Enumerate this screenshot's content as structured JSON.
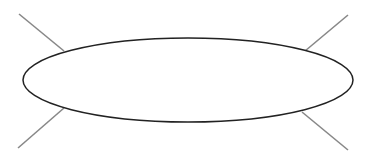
{
  "diagram": {
    "shape": "ellipse",
    "ellipse": {
      "cx": 188,
      "cy": 80,
      "rx": 165,
      "ry": 42,
      "stroke": "#222222",
      "fill": "#ffffff"
    },
    "line_color": "#888888",
    "lines": [
      {
        "name": "top-left",
        "x1": 19,
        "y1": 14,
        "x2": 64,
        "y2": 51
      },
      {
        "name": "bottom-left",
        "x1": 64,
        "y1": 108,
        "x2": 18,
        "y2": 148
      },
      {
        "name": "top-right",
        "x1": 348,
        "y1": 15,
        "x2": 305,
        "y2": 51
      },
      {
        "name": "bottom-right",
        "x1": 302,
        "y1": 112,
        "x2": 348,
        "y2": 150
      }
    ]
  }
}
